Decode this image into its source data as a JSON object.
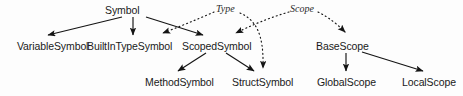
{
  "diagram": {
    "kind": "class-hierarchy",
    "background_color": "#fdfdfd",
    "text_color": "#1a1a1a",
    "edge_color": "#1a1a1a",
    "nodes": [
      {
        "id": "symbol",
        "label": "Symbol",
        "x": 105,
        "y": 4,
        "cx": 133,
        "cy": 10
      },
      {
        "id": "variable-symbol",
        "label": "VariableSymbol",
        "x": 17,
        "y": 40,
        "cx": 55,
        "cy": 46
      },
      {
        "id": "builtin-type-symbol",
        "label": "BuiltInTypeSymbol",
        "x": 87,
        "y": 40,
        "cx": 133,
        "cy": 46
      },
      {
        "id": "scoped-symbol",
        "label": "ScopedSymbol",
        "x": 182,
        "y": 40,
        "cx": 217,
        "cy": 46
      },
      {
        "id": "base-scope",
        "label": "BaseScope",
        "x": 316,
        "y": 40,
        "cx": 345,
        "cy": 46
      },
      {
        "id": "method-symbol",
        "label": "MethodSymbol",
        "x": 145,
        "y": 76,
        "cx": 180,
        "cy": 82
      },
      {
        "id": "struct-symbol",
        "label": "StructSymbol",
        "x": 232,
        "y": 76,
        "cx": 264,
        "cy": 82
      },
      {
        "id": "global-scope",
        "label": "GlobalScope",
        "x": 317,
        "y": 76,
        "cx": 348,
        "cy": 82
      },
      {
        "id": "local-scope",
        "label": "LocalScope",
        "x": 402,
        "y": 76,
        "cx": 430,
        "cy": 82
      }
    ],
    "edge_labels": [
      {
        "id": "type-label",
        "label": "Type",
        "x": 216,
        "y": 3
      },
      {
        "id": "scope-label",
        "label": "Scope",
        "x": 290,
        "y": 3
      }
    ],
    "edges": [
      {
        "id": "symbol-to-variable-symbol",
        "from": "symbol",
        "to": "variable-symbol",
        "style": "solid",
        "kind": "inheritance"
      },
      {
        "id": "symbol-to-builtin-type-symbol",
        "from": "symbol",
        "to": "builtin-type-symbol",
        "style": "solid",
        "kind": "inheritance"
      },
      {
        "id": "symbol-to-scoped-symbol",
        "from": "symbol",
        "to": "scoped-symbol",
        "style": "solid",
        "kind": "inheritance"
      },
      {
        "id": "scoped-symbol-to-method-symbol",
        "from": "scoped-symbol",
        "to": "method-symbol",
        "style": "solid",
        "kind": "inheritance"
      },
      {
        "id": "scoped-symbol-to-struct-symbol",
        "from": "scoped-symbol",
        "to": "struct-symbol",
        "style": "solid",
        "kind": "inheritance"
      },
      {
        "id": "base-scope-to-global-scope",
        "from": "base-scope",
        "to": "global-scope",
        "style": "solid",
        "kind": "inheritance"
      },
      {
        "id": "base-scope-to-local-scope",
        "from": "base-scope",
        "to": "local-scope",
        "style": "solid",
        "kind": "inheritance"
      },
      {
        "id": "type-to-builtin-type-symbol",
        "from": "type-label",
        "to": "builtin-type-symbol",
        "style": "dotted",
        "kind": "implements"
      },
      {
        "id": "type-to-struct-symbol",
        "from": "type-label",
        "to": "struct-symbol",
        "style": "dotted",
        "kind": "implements"
      },
      {
        "id": "scope-to-scoped-symbol",
        "from": "scope-label",
        "to": "scoped-symbol",
        "style": "dotted",
        "kind": "implements"
      },
      {
        "id": "scope-to-base-scope",
        "from": "scope-label",
        "to": "base-scope",
        "style": "dotted",
        "kind": "implements"
      }
    ]
  }
}
